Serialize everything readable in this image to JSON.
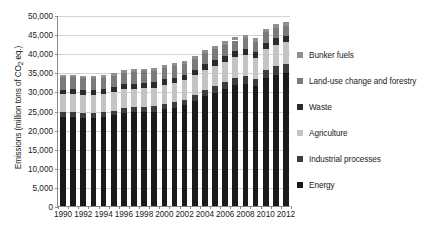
{
  "chart_data": {
    "type": "bar",
    "subtype": "stacked-column",
    "title": "",
    "xlabel": "",
    "ylabel": "Emissions (million tons of CO2 eq.)",
    "ylabel_parts": {
      "before": "Emissions (million tons of CO",
      "sub": "2",
      "after": " eq.)"
    },
    "ylim": [
      0,
      50000
    ],
    "ytick_step": 5000,
    "ytick_labels": [
      "50,000",
      "45,000",
      "40,000",
      "35,000",
      "30,000",
      "25,000",
      "20,000",
      "15,000",
      "10,000",
      "5,000",
      "0"
    ],
    "ytick_values": [
      50000,
      45000,
      40000,
      35000,
      30000,
      25000,
      20000,
      15000,
      10000,
      5000,
      0
    ],
    "grid": true,
    "grid_axis": "y",
    "legend_position": "right",
    "categories": [
      1990,
      1991,
      1992,
      1993,
      1994,
      1995,
      1996,
      1997,
      1998,
      1999,
      2000,
      2001,
      2002,
      2003,
      2004,
      2005,
      2006,
      2007,
      2008,
      2009,
      2010,
      2011,
      2012
    ],
    "xtick_labels": [
      "1990",
      "1992",
      "1994",
      "1996",
      "1998",
      "2000",
      "2002",
      "2004",
      "2006",
      "2008",
      "2010",
      "2012"
    ],
    "xtick_label_every": 2,
    "series": [
      {
        "name": "Energy",
        "color": "#1a1a1a",
        "values": [
          23200,
          23250,
          23100,
          23150,
          23250,
          23700,
          24350,
          24500,
          24600,
          24700,
          25400,
          25750,
          26350,
          27500,
          28800,
          29650,
          30600,
          31600,
          32050,
          31300,
          33450,
          34400,
          34900
        ]
      },
      {
        "name": "Industrial processes",
        "color": "#3d3d3d",
        "values": [
          1300,
          1280,
          1250,
          1250,
          1280,
          1300,
          1320,
          1340,
          1350,
          1370,
          1420,
          1440,
          1500,
          1600,
          1700,
          1780,
          1870,
          1960,
          1990,
          1900,
          2100,
          2200,
          2250
        ]
      },
      {
        "name": "Agriculture",
        "color": "#c4c4c4",
        "values": [
          4700,
          4720,
          4700,
          4720,
          4760,
          4800,
          4840,
          4870,
          4900,
          4930,
          4980,
          5020,
          5080,
          5150,
          5230,
          5300,
          5360,
          5420,
          5470,
          5500,
          5570,
          5630,
          5680
        ]
      },
      {
        "name": "Waste",
        "color": "#2b2b2b",
        "values": [
          1250,
          1260,
          1270,
          1280,
          1290,
          1300,
          1320,
          1330,
          1350,
          1360,
          1390,
          1400,
          1420,
          1450,
          1480,
          1500,
          1530,
          1550,
          1570,
          1580,
          1610,
          1630,
          1650
        ]
      },
      {
        "name": "Land-use change and forestry",
        "color": "#7a7a7a",
        "values": [
          3200,
          3150,
          3100,
          3080,
          3060,
          3050,
          3040,
          3030,
          3020,
          3000,
          2980,
          2960,
          2940,
          2900,
          2880,
          2850,
          2820,
          2800,
          2780,
          2750,
          2730,
          2700,
          2680
        ]
      },
      {
        "name": "Bunker fuels",
        "color": "#8f8f8f",
        "values": [
          620,
          625,
          630,
          640,
          650,
          665,
          680,
          700,
          715,
          730,
          760,
          755,
          770,
          800,
          850,
          890,
          930,
          980,
          1000,
          960,
          1010,
          1050,
          1080
        ]
      }
    ],
    "legend_entries": [
      {
        "label": "Bunker fuels",
        "color": "#8f8f8f"
      },
      {
        "label": "Land-use change and forestry",
        "color": "#7a7a7a"
      },
      {
        "label": "Waste",
        "color": "#2b2b2b"
      },
      {
        "label": "Agriculture",
        "color": "#c4c4c4"
      },
      {
        "label": "Industrial processes",
        "color": "#3d3d3d"
      },
      {
        "label": "Energy",
        "color": "#1a1a1a"
      }
    ],
    "totals": [
      34270,
      34285,
      34050,
      34120,
      34290,
      34815,
      35550,
      35770,
      35935,
      36090,
      36930,
      37325,
      38060,
      39400,
      40940,
      41970,
      43110,
      44310,
      44860,
      43990,
      46470,
      47610,
      48240
    ]
  }
}
